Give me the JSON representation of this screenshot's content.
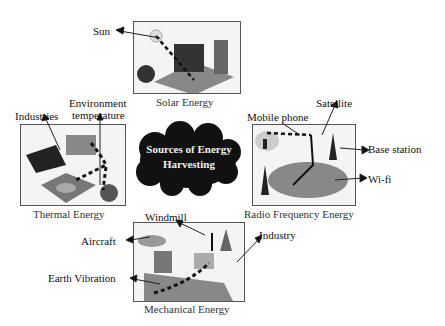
{
  "center": {
    "line1": "Sources of Energy",
    "line2": "Harvesting"
  },
  "solar": {
    "caption": "Solar Energy",
    "labels": {
      "sun": "Sun"
    }
  },
  "thermal": {
    "caption": "Thermal Energy",
    "labels": {
      "industries": "Industries",
      "env1": "Environment",
      "env2": "temperature"
    }
  },
  "rf": {
    "caption": "Radio Frequency Energy",
    "labels": {
      "mobile": "Mobile phone",
      "satellite": "Satellite",
      "base": "Base station",
      "wifi": "Wi-fi"
    }
  },
  "mechanical": {
    "caption": "Mechanical Energy",
    "labels": {
      "windmill": "Windmill",
      "aircraft": "Aircraft",
      "industry": "Industry",
      "earth": "Earth Vibration"
    }
  }
}
